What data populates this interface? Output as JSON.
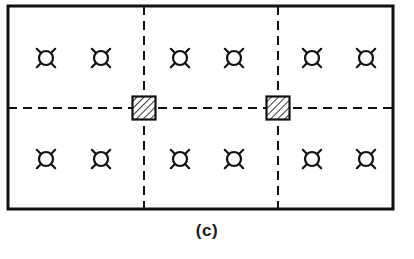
{
  "figure": {
    "caption": "(c)",
    "kind": "foundation-plan-diagram",
    "colors": {
      "ink": "#111111",
      "background": "#ffffff",
      "hatch": "#111111"
    },
    "frame": {
      "x": 8,
      "y": 6,
      "width": 385,
      "height": 203,
      "stroke_width": 3
    },
    "centerlines": {
      "stroke_width": 2,
      "dash": "9 6",
      "vertical": [
        {
          "name": "vertical-centerline-left",
          "x": 144
        },
        {
          "name": "vertical-centerline-right",
          "x": 278
        }
      ],
      "horizontal": [
        {
          "name": "horizontal-centerline",
          "y": 108
        }
      ]
    },
    "columns": [
      {
        "name": "hatched-column-left",
        "cx": 144,
        "cy": 108,
        "size": 23
      },
      {
        "name": "hatched-column-right",
        "cx": 278,
        "cy": 108,
        "size": 23
      }
    ],
    "anchor_bolts": {
      "symbol": "anchor-bolt-icon",
      "radius": 7,
      "leg_length": 6,
      "count": 12,
      "rows": [
        {
          "name": "anchor-bolt-row-top",
          "y": 58,
          "points": [
            46,
            101,
            180,
            234,
            312,
            366
          ]
        },
        {
          "name": "anchor-bolt-row-bottom",
          "y": 159,
          "points": [
            46,
            101,
            180,
            234,
            312,
            366
          ]
        }
      ]
    }
  }
}
